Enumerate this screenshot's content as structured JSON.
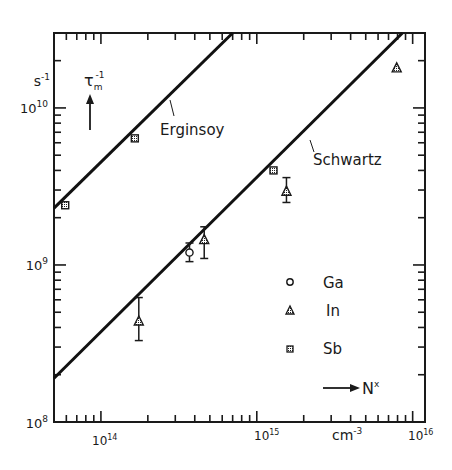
{
  "chart_data": {
    "type": "scatter",
    "title": "",
    "xlabel": "N^x",
    "xunit": "cm^-3",
    "ylabel": "τ_m^-1",
    "yunit": "s^-1",
    "xscale": "log",
    "yscale": "log",
    "xlim": [
      50000000000000.0,
      1.2e+16
    ],
    "ylim": [
      100000000.0,
      30000000000.0
    ],
    "x_tick_labels": [
      {
        "value": 100000000000000.0,
        "label": "10",
        "exp": "14"
      },
      {
        "value": 1000000000000000.0,
        "label": "10",
        "exp": "15"
      },
      {
        "value": 1e+16,
        "label": "10",
        "exp": "16"
      }
    ],
    "y_tick_labels": [
      {
        "value": 100000000.0,
        "label": "10",
        "exp": "8"
      },
      {
        "value": 1000000000.0,
        "label": "10",
        "exp": "9"
      },
      {
        "value": 10000000000.0,
        "label": "10",
        "exp": "10"
      }
    ],
    "grid": false,
    "legend_position": "lower-right-inside",
    "lines": [
      {
        "name": "Erginsoy",
        "x": [
          50000000000000.0,
          700000000000000.0
        ],
        "y": [
          2300000000.0,
          30000000000.0
        ]
      },
      {
        "name": "Schwartz",
        "x": [
          50000000000000.0,
          8600000000000000.0
        ],
        "y": [
          190000000.0,
          30000000000.0
        ]
      }
    ],
    "series": [
      {
        "name": "Ga",
        "marker": "circle-open",
        "points": [
          {
            "x": 370000000000000.0,
            "y": 1200000000.0,
            "yerr_low": 1050000000.0,
            "yerr_high": 1380000000.0
          }
        ]
      },
      {
        "name": "In",
        "marker": "triangle-dotted",
        "points": [
          {
            "x": 175000000000000.0,
            "y": 440000000.0,
            "yerr_low": 330000000.0,
            "yerr_high": 620000000.0
          },
          {
            "x": 460000000000000.0,
            "y": 1450000000.0,
            "yerr_low": 1100000000.0,
            "yerr_high": 1750000000.0
          },
          {
            "x": 1550000000000000.0,
            "y": 2950000000.0,
            "yerr_low": 2500000000.0,
            "yerr_high": 3600000000.0
          },
          {
            "x": 7900000000000000.0,
            "y": 18000000000.0
          }
        ]
      },
      {
        "name": "Sb",
        "marker": "square-dotted",
        "points": [
          {
            "x": 59000000000000.0,
            "y": 2400000000.0
          },
          {
            "x": 165000000000000.0,
            "y": 6400000000.0
          },
          {
            "x": 1280000000000000.0,
            "y": 4000000000.0
          }
        ]
      }
    ],
    "annotations": [
      {
        "text": "Erginsoy",
        "attached_to": "Erginsoy"
      },
      {
        "text": "Schwartz",
        "attached_to": "Schwartz"
      }
    ]
  },
  "labels": {
    "y_unit_base": "s",
    "y_unit_exp": "-1",
    "y_quantity_base": "τ",
    "y_quantity_sub": "m",
    "y_quantity_exp": "-1",
    "x_unit_base": "cm",
    "x_unit_exp": "-3",
    "x_quantity_base": "N",
    "x_quantity_exp": "x",
    "erginsoy": "Erginsoy",
    "schwartz": "Schwartz",
    "legend_ga": "Ga",
    "legend_in": "In",
    "legend_sb": "Sb",
    "y10": "10",
    "y10_exp": "10",
    "y9": "10",
    "y9_exp": "9",
    "y8": "10",
    "y8_exp": "8",
    "x14": "10",
    "x14_exp": "14",
    "x15": "10",
    "x15_exp": "15",
    "x16": "10",
    "x16_exp": "16"
  }
}
